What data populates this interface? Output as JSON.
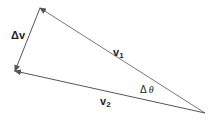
{
  "diagram": {
    "type": "vector-triangle",
    "colors": {
      "stroke": "#555555",
      "text": "#222222"
    },
    "vertices": {
      "top": [
        40,
        8
      ],
      "bottom_left": [
        15,
        71
      ],
      "right": [
        205,
        113
      ]
    },
    "vectors": [
      {
        "name": "v1",
        "from": "right",
        "to": "top",
        "label": "v",
        "subscript": "1"
      },
      {
        "name": "v2",
        "from": "right",
        "to": "bottom_left",
        "label": "v",
        "subscript": "2"
      },
      {
        "name": "delta_v",
        "from": "top",
        "to": "bottom_left",
        "label": "Δv"
      }
    ],
    "angle_label": {
      "delta": "Δ",
      "symbol": "θ"
    }
  }
}
